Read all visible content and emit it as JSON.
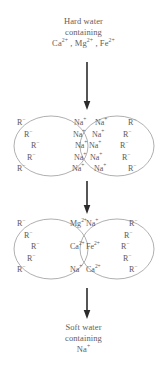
{
  "diagram": {
    "title_top": {
      "lines": [
        "Hard water",
        "containing",
        "Ca2+ , Mg2+ , Fe2+"
      ],
      "line1": "Hard water",
      "line2": "containing",
      "ions": [
        {
          "symbol": "Ca",
          "charge": "2+"
        },
        {
          "symbol": "Mg",
          "charge": "2+"
        },
        {
          "symbol": "Fe",
          "charge": "2+"
        }
      ]
    },
    "title_bottom": {
      "line1": "Soft water",
      "line2": "containing",
      "ions": [
        {
          "symbol": "Na",
          "charge": "+"
        }
      ]
    },
    "arrows": [
      {
        "name": "arrow-top",
        "direction": "down"
      },
      {
        "name": "arrow-middle",
        "direction": "down"
      },
      {
        "name": "arrow-bottom",
        "direction": "down"
      }
    ],
    "stage_1": {
      "label": "resin-beads-sodium-form",
      "left_bead": {
        "resin": [
          {
            "symbol": "R",
            "charge": "−"
          },
          {
            "symbol": "R",
            "charge": "−"
          },
          {
            "symbol": "R",
            "charge": "−"
          },
          {
            "symbol": "R",
            "charge": "−"
          },
          {
            "symbol": "R",
            "charge": "−"
          }
        ],
        "counter_ions": [
          {
            "symbol": "Na",
            "charge": "+"
          },
          {
            "symbol": "Na",
            "charge": "+"
          },
          {
            "symbol": "Na",
            "charge": "+"
          },
          {
            "symbol": "Na",
            "charge": "+"
          },
          {
            "symbol": "Na",
            "charge": "+"
          }
        ]
      },
      "right_bead": {
        "counter_ions": [
          {
            "symbol": "Na",
            "charge": "+"
          },
          {
            "symbol": "Na",
            "charge": "+"
          },
          {
            "symbol": "Na",
            "charge": "+"
          },
          {
            "symbol": "Na",
            "charge": "+"
          },
          {
            "symbol": "Na",
            "charge": "+"
          }
        ],
        "resin": [
          {
            "symbol": "R",
            "charge": "−"
          },
          {
            "symbol": "R",
            "charge": "−"
          },
          {
            "symbol": "R",
            "charge": "−"
          },
          {
            "symbol": "R",
            "charge": "−"
          },
          {
            "symbol": "R",
            "charge": "−"
          }
        ]
      }
    },
    "stage_2": {
      "label": "resin-beads-exchanged-form",
      "left_bead": {
        "resin": [
          {
            "symbol": "R",
            "charge": "−"
          },
          {
            "symbol": "R",
            "charge": "−"
          },
          {
            "symbol": "R",
            "charge": "−"
          },
          {
            "symbol": "R",
            "charge": "−"
          },
          {
            "symbol": "R",
            "charge": "−"
          }
        ],
        "counter_ions": [
          {
            "symbol": "Mg",
            "charge": "2+"
          },
          {
            "symbol": "",
            "charge": ""
          },
          {
            "symbol": "Ca",
            "charge": "2+"
          },
          {
            "symbol": "",
            "charge": ""
          },
          {
            "symbol": "Na",
            "charge": "+"
          }
        ]
      },
      "middle": {
        "counter_ions": [
          {
            "symbol": "Na",
            "charge": "+"
          },
          {
            "symbol": "",
            "charge": ""
          },
          {
            "symbol": "Fe",
            "charge": "2+"
          },
          {
            "symbol": "",
            "charge": ""
          },
          {
            "symbol": "Ca",
            "charge": "2+"
          }
        ]
      },
      "right_bead": {
        "resin": [
          {
            "symbol": "R",
            "charge": "−"
          },
          {
            "symbol": "R",
            "charge": "−"
          },
          {
            "symbol": "R",
            "charge": "−"
          },
          {
            "symbol": "R",
            "charge": "−"
          },
          {
            "symbol": "R",
            "charge": "−"
          }
        ]
      }
    },
    "colors": {
      "text": "#5e5e5e",
      "stroke": "#8c8c8c",
      "arrow": "#2b2b2b",
      "background": "#ffffff"
    }
  }
}
